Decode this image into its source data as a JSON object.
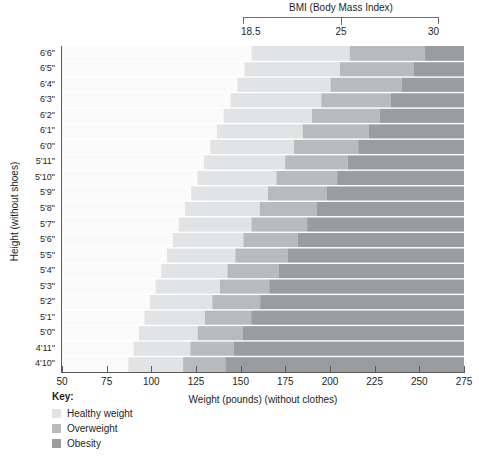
{
  "bmi_header": {
    "title": "BMI (Body Mass Index)",
    "ticks": [
      "18.5",
      "25",
      "30"
    ]
  },
  "axes": {
    "y_title": "Height (without shoes)",
    "x_title": "Weight (pounds) (without clothes)",
    "x_tick_labels": [
      "50",
      "75",
      "100",
      "125",
      "150",
      "175",
      "200",
      "225",
      "250",
      "275"
    ],
    "y_tick_labels": [
      "6'6\"",
      "6'5\"",
      "6'4\"",
      "6'3\"",
      "6'2\"",
      "6'1\"",
      "6'0\"",
      "5'11\"",
      "5'10\"",
      "5'9\"",
      "5'8\"",
      "5'7\"",
      "5'6\"",
      "5'5\"",
      "5'4\"",
      "5'3\"",
      "5'2\"",
      "5'1\"",
      "5'0\"",
      "4'11\"",
      "4'10\""
    ]
  },
  "legend": {
    "title": "Key:",
    "items": [
      {
        "label": "Healthy weight",
        "color": "#e2e3e4"
      },
      {
        "label": "Overweight",
        "color": "#b9babc"
      },
      {
        "label": "Obesity",
        "color": "#9a9c9e"
      }
    ]
  },
  "footer": {
    "caption": ""
  },
  "chart_data": {
    "type": "heatmap",
    "title": "BMI (Body Mass Index)",
    "xlabel": "Weight (pounds) (without clothes)",
    "ylabel": "Height (without shoes)",
    "xlim": [
      50,
      275
    ],
    "x_ticks": [
      50,
      75,
      100,
      125,
      150,
      175,
      200,
      225,
      250,
      275
    ],
    "grid": false,
    "legend_position": "bottom-left",
    "bmi_thresholds": [
      18.5,
      25,
      30
    ],
    "zone_colors": {
      "underweight": "#fbfbfb",
      "healthy": "#e2e3e4",
      "overweight": "#b9babc",
      "obesity": "#9a9c9e"
    },
    "row_separator_color": "#ffffff",
    "rows": [
      {
        "height_label": "6'6\"",
        "height_in": 78,
        "bmi18_5_lb": 156.1,
        "bmi25_lb": 211.0,
        "bmi30_lb": 253.2
      },
      {
        "height_label": "6'5\"",
        "height_in": 77,
        "bmi18_5_lb": 152.1,
        "bmi25_lb": 205.6,
        "bmi30_lb": 246.7
      },
      {
        "height_label": "6'4\"",
        "height_in": 76,
        "bmi18_5_lb": 148.2,
        "bmi25_lb": 200.3,
        "bmi30_lb": 240.3
      },
      {
        "height_label": "6'3\"",
        "height_in": 75,
        "bmi18_5_lb": 144.3,
        "bmi25_lb": 195.1,
        "bmi30_lb": 234.1
      },
      {
        "height_label": "6'2\"",
        "height_in": 74,
        "bmi18_5_lb": 140.5,
        "bmi25_lb": 189.9,
        "bmi30_lb": 227.9
      },
      {
        "height_label": "6'1\"",
        "height_in": 73,
        "bmi18_5_lb": 136.7,
        "bmi25_lb": 184.8,
        "bmi30_lb": 221.8
      },
      {
        "height_label": "6'0\"",
        "height_in": 72,
        "bmi18_5_lb": 133.0,
        "bmi25_lb": 179.8,
        "bmi30_lb": 215.8
      },
      {
        "height_label": "5'11\"",
        "height_in": 71,
        "bmi18_5_lb": 129.4,
        "bmi25_lb": 174.9,
        "bmi30_lb": 209.9
      },
      {
        "height_label": "5'10\"",
        "height_in": 70,
        "bmi18_5_lb": 125.8,
        "bmi25_lb": 170.0,
        "bmi30_lb": 204.0
      },
      {
        "height_label": "5'9\"",
        "height_in": 69,
        "bmi18_5_lb": 122.3,
        "bmi25_lb": 165.3,
        "bmi30_lb": 198.3
      },
      {
        "height_label": "5'8\"",
        "height_in": 68,
        "bmi18_5_lb": 118.8,
        "bmi25_lb": 160.6,
        "bmi30_lb": 192.7
      },
      {
        "height_label": "5'7\"",
        "height_in": 67,
        "bmi18_5_lb": 115.4,
        "bmi25_lb": 156.0,
        "bmi30_lb": 187.2
      },
      {
        "height_label": "5'6\"",
        "height_in": 66,
        "bmi18_5_lb": 112.1,
        "bmi25_lb": 151.5,
        "bmi30_lb": 181.8
      },
      {
        "height_label": "5'5\"",
        "height_in": 65,
        "bmi18_5_lb": 108.8,
        "bmi25_lb": 147.0,
        "bmi30_lb": 176.4
      },
      {
        "height_label": "5'4\"",
        "height_in": 64,
        "bmi18_5_lb": 105.5,
        "bmi25_lb": 142.6,
        "bmi30_lb": 171.2
      },
      {
        "height_label": "5'3\"",
        "height_in": 63,
        "bmi18_5_lb": 102.4,
        "bmi25_lb": 138.4,
        "bmi30_lb": 166.0
      },
      {
        "height_label": "5'2\"",
        "height_in": 62,
        "bmi18_5_lb": 99.2,
        "bmi25_lb": 134.1,
        "bmi30_lb": 160.9
      },
      {
        "height_label": "5'1\"",
        "height_in": 61,
        "bmi18_5_lb": 96.1,
        "bmi25_lb": 130.0,
        "bmi30_lb": 155.9
      },
      {
        "height_label": "5'0\"",
        "height_in": 60,
        "bmi18_5_lb": 93.1,
        "bmi25_lb": 125.9,
        "bmi30_lb": 151.0
      },
      {
        "height_label": "4'11\"",
        "height_in": 59,
        "bmi18_5_lb": 90.1,
        "bmi25_lb": 121.8,
        "bmi30_lb": 146.1
      },
      {
        "height_label": "4'10\"",
        "height_in": 58,
        "bmi18_5_lb": 87.1,
        "bmi25_lb": 117.8,
        "bmi30_lb": 141.4
      }
    ]
  }
}
